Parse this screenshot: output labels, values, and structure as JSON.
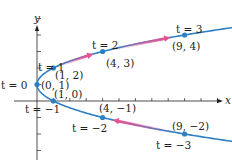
{
  "diagram": {
    "type": "parametric-curve",
    "equations": {
      "x": "t^2",
      "y": "t + 1"
    },
    "origin_px": [
      37,
      101
    ],
    "scale_px": [
      16.4,
      16.5
    ],
    "axes": {
      "x_label": "x",
      "y_label": "y",
      "x_ticks": [
        1,
        2,
        3,
        4,
        5,
        6,
        7,
        8,
        9,
        10,
        11,
        12
      ],
      "y_ticks": [
        -3,
        -2,
        -1,
        1,
        2,
        3,
        4,
        5
      ]
    },
    "colors": {
      "curve": "#2d7fc4",
      "point": "#2d7fc4",
      "arrow": "#e8508f",
      "axis": "#231f20",
      "text": "#231f20"
    },
    "points": [
      {
        "t": -3,
        "x": 9,
        "y": -2,
        "t_label": "t = −3",
        "coord_label": "(9, −2)"
      },
      {
        "t": -2,
        "x": 4,
        "y": -1,
        "t_label": "t = −2",
        "coord_label": "(4, −1)"
      },
      {
        "t": -1,
        "x": 1,
        "y": 0,
        "t_label": "t = −1",
        "coord_label": "(1, 0)"
      },
      {
        "t": 0,
        "x": 0,
        "y": 1,
        "t_label": "t = 0",
        "coord_label": "(0, 1)"
      },
      {
        "t": 1,
        "x": 1,
        "y": 2,
        "t_label": "t = 1",
        "coord_label": "(1, 2)"
      },
      {
        "t": 2,
        "x": 4,
        "y": 3,
        "t_label": "t = 2",
        "coord_label": "(4, 3)"
      },
      {
        "t": 3,
        "x": 9,
        "y": 4,
        "t_label": "t = 3",
        "coord_label": "(9, 4)"
      }
    ],
    "arrows": [
      {
        "t": -2.5,
        "direction": "increasing-t"
      },
      {
        "t": 1.5,
        "direction": "increasing-t"
      },
      {
        "t": 2.5,
        "direction": "increasing-t"
      }
    ]
  }
}
